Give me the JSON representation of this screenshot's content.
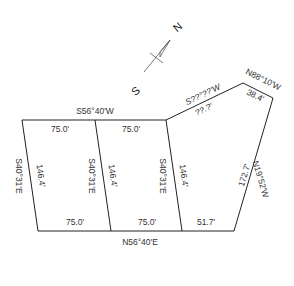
{
  "north_arrow": {
    "north_label": "N",
    "south_label": "S"
  },
  "boundary": {
    "top_bearing": "S56°40'W",
    "slant_bearing": "S??°??'W",
    "slant_distance": "??.?'",
    "top_right_bearing": "N88°10'W",
    "top_right_distance": "38.4'",
    "right_bearing": "N19°52'W",
    "right_distance": "172.7'",
    "bottom_bearing": "N56°40'E",
    "left_bearing": "S40°31'E"
  },
  "lots": [
    {
      "top_frontage": "75.0'",
      "bottom_frontage": "75.0'",
      "side_distance": "146.4'"
    },
    {
      "top_frontage": "75.0'",
      "bottom_frontage": "75.0'",
      "side_distance": "146.4'",
      "side_bearing": "S40°31'E"
    },
    {
      "bottom_frontage": "51.7'",
      "side_distance": "146.4'",
      "side_bearing": "S40°31'E"
    }
  ],
  "colors": {
    "line": "#222222",
    "text": "#333333",
    "background": "#ffffff"
  }
}
